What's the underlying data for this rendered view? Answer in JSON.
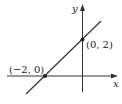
{
  "diagram": {
    "type": "coordinate-plane-line",
    "axes": {
      "x_label": "x",
      "y_label": "y"
    },
    "points": [
      {
        "label": "(0, 2)",
        "x": 0,
        "y": 2
      },
      {
        "label": "(−2, 0)",
        "x": -2,
        "y": 0
      }
    ],
    "line": {
      "slope": 1,
      "intercept": 2
    },
    "colors": {
      "stroke": "#333333",
      "point": "#222222",
      "background": "#ffffff"
    }
  }
}
